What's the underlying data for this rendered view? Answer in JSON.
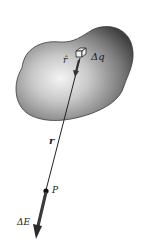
{
  "diagram": {
    "type": "physics-electric-field-from-charge-element",
    "labels": {
      "unit_vector": "r̂",
      "charge_element": "Δq",
      "distance": "r",
      "point": "P",
      "field_element": "ΔE"
    },
    "colors": {
      "background": "#ffffff",
      "blob_light": "#f2f2f2",
      "blob_dark": "#4a4a4a",
      "line": "#222222",
      "arrow": "#3a3a3a"
    }
  }
}
